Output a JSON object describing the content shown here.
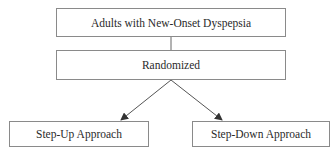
{
  "diagram": {
    "type": "flowchart",
    "nodes": [
      {
        "id": "population",
        "label": "Adults with New-Onset Dyspepsia"
      },
      {
        "id": "randomized",
        "label": "Randomized"
      },
      {
        "id": "step_up",
        "label": "Step-Up Approach"
      },
      {
        "id": "step_down",
        "label": "Step-Down Approach"
      }
    ],
    "edges": [
      {
        "from": "population",
        "to": "randomized",
        "style": "line"
      },
      {
        "from": "randomized",
        "to": "step_up",
        "style": "arrow"
      },
      {
        "from": "randomized",
        "to": "step_down",
        "style": "arrow"
      }
    ],
    "colors": {
      "border": "#8a8a8a",
      "line": "#555555",
      "text": "#2a2a2a"
    }
  }
}
